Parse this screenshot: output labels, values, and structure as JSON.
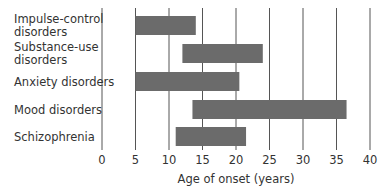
{
  "chart_data": {
    "type": "bar",
    "orientation": "horizontal-range",
    "title": "",
    "xlabel": "Age of onset (years)",
    "ylabel": "",
    "xlim": [
      0,
      40
    ],
    "xticks": [
      0,
      5,
      10,
      15,
      20,
      25,
      30,
      35,
      40
    ],
    "grid": "vertical",
    "legend": "none",
    "categories": [
      [
        "Impulse-control",
        "disorders"
      ],
      [
        "Substance-use",
        "disorders"
      ],
      [
        "Anxiety disorders"
      ],
      [
        "Mood disorders"
      ],
      [
        "Schizophrenia"
      ]
    ],
    "ranges": [
      {
        "name": "Impulse-control disorders",
        "start": 5,
        "end": 14
      },
      {
        "name": "Substance-use disorders",
        "start": 12,
        "end": 24
      },
      {
        "name": "Anxiety disorders",
        "start": 5,
        "end": 20.5
      },
      {
        "name": "Mood disorders",
        "start": 13.5,
        "end": 36.5
      },
      {
        "name": "Schizophrenia",
        "start": 11,
        "end": 21.5
      }
    ],
    "bar_color": "#6b6b6b"
  }
}
